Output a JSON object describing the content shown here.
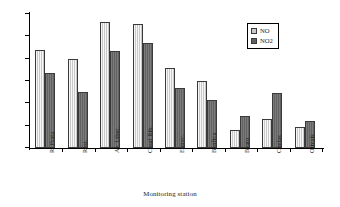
{
  "chart_data": {
    "type": "bar",
    "title": "",
    "xlabel": "Monitoring station",
    "ylabel": "",
    "categories": [
      "R. Prata",
      "Rest.",
      "Av. Liber.",
      "Casal Rib.",
      "Entrec.",
      "Benfica",
      "Beato",
      "Chelas",
      "Olivais"
    ],
    "series": [
      {
        "name": "NO",
        "values": [
          88,
          80,
          113,
          111,
          72,
          60,
          16,
          26,
          19
        ]
      },
      {
        "name": "NO2",
        "values": [
          67,
          50,
          87,
          94,
          54,
          43,
          29,
          49,
          24
        ]
      }
    ],
    "ylim": [
      0,
      120
    ],
    "yticks": [
      "0.0",
      "20.0",
      "40.0",
      "60.0",
      "80.0",
      "100.0",
      "120.0"
    ],
    "ytick_values": [
      0,
      20,
      40,
      60,
      80,
      100,
      120
    ],
    "grid": false,
    "legend_position": "top-right",
    "colors": {
      "NO": "#c9c9c9",
      "NO2": "#626262",
      "bar_border": "#3a3a3a",
      "axis": "#000000",
      "background": "#ffffff"
    }
  },
  "legend": {
    "entries": [
      {
        "label": "NO",
        "series": "NO"
      },
      {
        "label": "NO2",
        "series": "NO2"
      }
    ]
  }
}
